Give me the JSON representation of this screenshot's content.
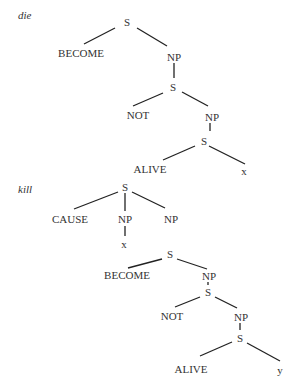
{
  "diagrams": [
    {
      "title": "die",
      "nodes": [
        {
          "id": "d_S1",
          "label": "S",
          "x": 127,
          "y": 22
        },
        {
          "id": "d_BECOME",
          "label": "BECOME",
          "x": 81,
          "y": 53
        },
        {
          "id": "d_NP1",
          "label": "NP",
          "x": 174,
          "y": 57
        },
        {
          "id": "d_S2",
          "label": "S",
          "x": 173,
          "y": 87
        },
        {
          "id": "d_NOT",
          "label": "NOT",
          "x": 138,
          "y": 115
        },
        {
          "id": "d_NP2",
          "label": "NP",
          "x": 212,
          "y": 117
        },
        {
          "id": "d_S3",
          "label": "S",
          "x": 204,
          "y": 141
        },
        {
          "id": "d_ALIVE",
          "label": "ALIVE",
          "x": 150,
          "y": 169
        },
        {
          "id": "d_x",
          "label": "x",
          "x": 244,
          "y": 171
        }
      ],
      "edges": [
        [
          115,
          28,
          84,
          44
        ],
        [
          137,
          28,
          167,
          46
        ],
        [
          174,
          63,
          174,
          78
        ],
        [
          163,
          93,
          133,
          106
        ],
        [
          182,
          92,
          208,
          106
        ],
        [
          210,
          123,
          210,
          131
        ],
        [
          195,
          146,
          163,
          160
        ],
        [
          209,
          146,
          245,
          164
        ]
      ]
    },
    {
      "title": "kill",
      "nodes": [
        {
          "id": "k_S1",
          "label": "S",
          "x": 125,
          "y": 187
        },
        {
          "id": "k_CAUSE",
          "label": "CAUSE",
          "x": 70,
          "y": 219
        },
        {
          "id": "k_NP1",
          "label": "NP",
          "x": 125,
          "y": 219
        },
        {
          "id": "k_NP2",
          "label": "NP",
          "x": 171,
          "y": 219
        },
        {
          "id": "k_x",
          "label": "x",
          "x": 124,
          "y": 244
        },
        {
          "id": "k_S2",
          "label": "S",
          "x": 170,
          "y": 254
        },
        {
          "id": "k_BECOME",
          "label": "BECOME",
          "x": 127,
          "y": 275
        },
        {
          "id": "k_NP3",
          "label": "NP",
          "x": 209,
          "y": 276
        },
        {
          "id": "k_S3",
          "label": "S",
          "x": 208,
          "y": 292
        },
        {
          "id": "k_NOT",
          "label": "NOT",
          "x": 172,
          "y": 316
        },
        {
          "id": "k_NP4",
          "label": "NP",
          "x": 241,
          "y": 317
        },
        {
          "id": "k_S4",
          "label": "S",
          "x": 240,
          "y": 338
        },
        {
          "id": "k_ALIVE",
          "label": "ALIVE",
          "x": 191,
          "y": 369
        },
        {
          "id": "k_y",
          "label": "y",
          "x": 280,
          "y": 370
        }
      ],
      "edges": [
        [
          118,
          192,
          74,
          209
        ],
        [
          125,
          193,
          125,
          211
        ],
        [
          132,
          192,
          165,
          208
        ],
        [
          125,
          226,
          125,
          236
        ],
        [
          162,
          259,
          128,
          268
        ],
        [
          177,
          259,
          207,
          269
        ],
        [
          208,
          282,
          208,
          285
        ],
        [
          200,
          297,
          175,
          307
        ],
        [
          215,
          297,
          237,
          308
        ],
        [
          240,
          323,
          240,
          330
        ],
        [
          232,
          342,
          200,
          356
        ],
        [
          247,
          343,
          280,
          361
        ]
      ]
    }
  ],
  "colors": {
    "text": "#333333",
    "line": "#222222",
    "background": "#ffffff"
  }
}
